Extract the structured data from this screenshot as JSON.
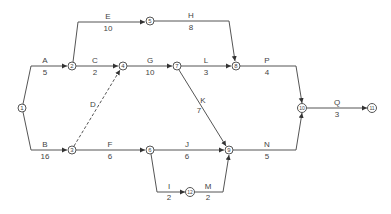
{
  "diagram": {
    "type": "activity-on-arrow network",
    "nodes": [
      {
        "id": "1",
        "label": "1",
        "x": 22,
        "y": 108
      },
      {
        "id": "2",
        "label": "2",
        "x": 72,
        "y": 66
      },
      {
        "id": "3",
        "label": "3",
        "x": 72,
        "y": 150
      },
      {
        "id": "4",
        "label": "4",
        "x": 123,
        "y": 66
      },
      {
        "id": "5",
        "label": "5",
        "x": 150,
        "y": 21
      },
      {
        "id": "6",
        "label": "6",
        "x": 150,
        "y": 150
      },
      {
        "id": "7",
        "label": "7",
        "x": 177,
        "y": 66
      },
      {
        "id": "8",
        "label": "8",
        "x": 236,
        "y": 66
      },
      {
        "id": "9",
        "label": "9",
        "x": 229,
        "y": 150
      },
      {
        "id": "10",
        "label": "10",
        "x": 302,
        "y": 108
      },
      {
        "id": "11",
        "label": "11",
        "x": 372,
        "y": 108
      },
      {
        "id": "12",
        "label": "12",
        "x": 190,
        "y": 192
      }
    ],
    "activities": [
      {
        "name": "A",
        "duration": "5",
        "from": "1",
        "to": "2"
      },
      {
        "name": "B",
        "duration": "16",
        "from": "1",
        "to": "3"
      },
      {
        "name": "C",
        "duration": "2",
        "from": "2",
        "to": "4"
      },
      {
        "name": "D",
        "duration": "",
        "from": "3",
        "to": "4",
        "dummy": true
      },
      {
        "name": "E",
        "duration": "10",
        "from": "2",
        "to": "5"
      },
      {
        "name": "F",
        "duration": "6",
        "from": "3",
        "to": "6"
      },
      {
        "name": "G",
        "duration": "10",
        "from": "4",
        "to": "7"
      },
      {
        "name": "H",
        "duration": "8",
        "from": "5",
        "to": "8"
      },
      {
        "name": "I",
        "duration": "2",
        "from": "6",
        "to": "12"
      },
      {
        "name": "J",
        "duration": "6",
        "from": "6",
        "to": "9"
      },
      {
        "name": "K",
        "duration": "7",
        "from": "7",
        "to": "9"
      },
      {
        "name": "L",
        "duration": "3",
        "from": "7",
        "to": "8"
      },
      {
        "name": "M",
        "duration": "2",
        "from": "12",
        "to": "9"
      },
      {
        "name": "N",
        "duration": "5",
        "from": "9",
        "to": "10"
      },
      {
        "name": "P",
        "duration": "4",
        "from": "8",
        "to": "10"
      },
      {
        "name": "Q",
        "duration": "3",
        "from": "10",
        "to": "11"
      }
    ]
  }
}
